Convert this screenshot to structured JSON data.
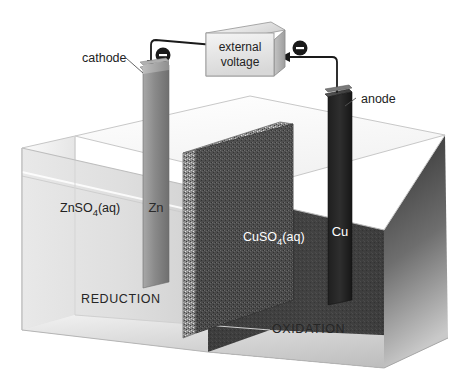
{
  "diagram": {
    "labels": {
      "cathode": "cathode",
      "anode": "anode",
      "external_voltage_line1": "external",
      "external_voltage_line2": "voltage",
      "left_solution": "ZnSO",
      "left_solution_sub": "4",
      "left_solution_tail": "(aq)",
      "right_solution": "CuSO",
      "right_solution_sub": "4",
      "right_solution_tail": "(aq)",
      "left_electrode": "Zn",
      "right_electrode": "Cu",
      "left_process": "REDUCTION",
      "right_process": "OXIDATION",
      "electron_left": "−",
      "electron_right": "−"
    },
    "colors": {
      "background": "#ffffff",
      "wire": "#1a1a1a",
      "electron_badge": "#1a1a1a",
      "electron_sign": "#ffffff",
      "glass_light": "#f2f2f2",
      "glass_mid": "#dcdcdc",
      "glass_edge": "#b9b9b9",
      "zn_solution": "#d8d8d8",
      "cu_solution": "#3c3c3c",
      "barrier_speckle": "#8e8e8e",
      "barrier_face": "#333333",
      "zn_electrode": "#8c8c8c",
      "cu_electrode": "#2e2e2e",
      "cathode_rod": "#9a9a9a",
      "anode_rod": "#6a6a6a",
      "text_dark": "#222222",
      "text_light": "#ffffff",
      "leader_line": "#555555"
    }
  }
}
